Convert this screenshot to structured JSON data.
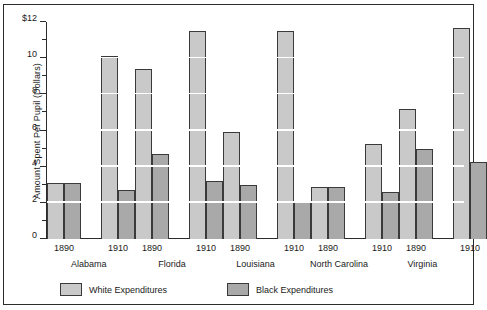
{
  "chart_data": {
    "type": "bar",
    "title": "",
    "subtitle": "",
    "xlabel": "",
    "ylabel": "Amount Spent Per Pupil (Dollars)",
    "ylim": [
      0,
      12
    ],
    "ytick_values": [
      0,
      2,
      4,
      6,
      8,
      10,
      12
    ],
    "ytick_labels": [
      "0",
      "2",
      "4",
      "6",
      "8",
      "10",
      "$12"
    ],
    "yminor_tick_values": [
      1,
      3,
      5,
      7,
      9,
      11
    ],
    "grid": "horizontal-white-lines-at-major-ticks",
    "legend_position": "bottom-left",
    "groups": [
      "Alabama",
      "Florida",
      "Louisiana",
      "North Carolina",
      "Virginia"
    ],
    "subgroups": [
      "1890",
      "1910"
    ],
    "categories": [
      "Alabama 1890",
      "Alabama 1910",
      "Florida 1890",
      "Florida 1910",
      "Louisiana 1890",
      "Louisiana 1910",
      "North Carolina 1890",
      "North Carolina 1910",
      "Virginia 1890",
      "Virginia 1910"
    ],
    "series": [
      {
        "name": "White Expenditures",
        "color": "#c9c9c9",
        "values": [
          3.1,
          10.1,
          9.4,
          11.5,
          5.9,
          11.5,
          2.85,
          5.25,
          7.2,
          11.65
        ]
      },
      {
        "name": "Black Expenditures",
        "color": "#a9a9a9",
        "values": [
          3.1,
          2.7,
          4.7,
          3.2,
          3.0,
          2.1,
          2.85,
          2.6,
          5.0,
          4.25
        ]
      }
    ],
    "data_by_group": [
      {
        "state": "Alabama",
        "years": [
          {
            "year": "1890",
            "white": 3.1,
            "black": 3.1
          },
          {
            "year": "1910",
            "white": 10.1,
            "black": 2.7
          }
        ]
      },
      {
        "state": "Florida",
        "years": [
          {
            "year": "1890",
            "white": 9.4,
            "black": 4.7
          },
          {
            "year": "1910",
            "white": 11.5,
            "black": 3.2
          }
        ]
      },
      {
        "state": "Louisiana",
        "years": [
          {
            "year": "1890",
            "white": 5.9,
            "black": 3.0
          },
          {
            "year": "1910",
            "white": 11.5,
            "black": 2.1
          }
        ]
      },
      {
        "state": "North Carolina",
        "years": [
          {
            "year": "1890",
            "white": 2.85,
            "black": 2.85
          },
          {
            "year": "1910",
            "white": 5.25,
            "black": 2.6
          }
        ]
      },
      {
        "state": "Virginia",
        "years": [
          {
            "year": "1890",
            "white": 7.2,
            "black": 5.0
          },
          {
            "year": "1910",
            "white": 11.65,
            "black": 4.25
          }
        ]
      }
    ]
  },
  "legend": {
    "items": [
      {
        "label": "White Expenditures",
        "color": "#c9c9c9"
      },
      {
        "label": "Black Expenditures",
        "color": "#a9a9a9"
      }
    ]
  },
  "colors": {
    "white_series": "#c9c9c9",
    "black_series": "#a9a9a9",
    "bar_outline": "#3a3a3a",
    "axis": "#2b2b2b",
    "gridline": "#ffffff",
    "background": "#ffffff",
    "text": "#1a1a1a"
  }
}
